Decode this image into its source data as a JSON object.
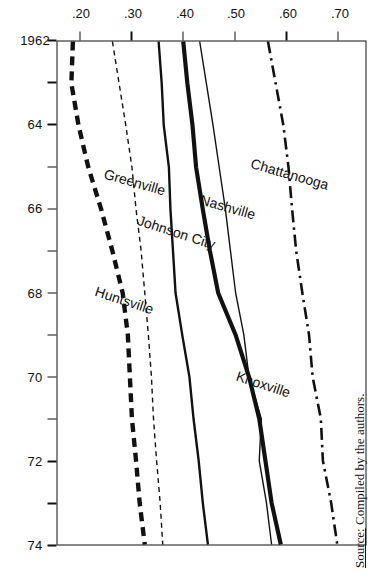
{
  "figure": {
    "y_axis_title": "Proportion",
    "source_prefix": "Source:",
    "source_text": "Compiled by the authors."
  },
  "chart_data": {
    "type": "line",
    "title": "",
    "xlabel": "",
    "ylabel": "Proportion",
    "xlim": [
      1962,
      1974
    ],
    "ylim": [
      0.155,
      0.755
    ],
    "grid": false,
    "legend": "inline-labels",
    "x": [
      1962,
      1963,
      1964,
      1965,
      1966,
      1967,
      1968,
      1969,
      1970,
      1971,
      1972,
      1973,
      1974
    ],
    "xtick_labels": [
      "1962",
      "",
      "64",
      "",
      "66",
      "",
      "68",
      "",
      "70",
      "",
      "72",
      "",
      "74"
    ],
    "ytick_values": [
      0.7,
      0.6,
      0.5,
      0.4,
      0.3,
      0.2
    ],
    "ytick_labels": [
      ".70",
      ".60",
      ".50",
      ".40",
      ".30",
      ".20"
    ],
    "series": [
      {
        "name": "Chattanooga",
        "style": "dash-dot",
        "width": 2.6,
        "color": "#111111",
        "values": [
          0.565,
          0.58,
          0.595,
          0.605,
          0.612,
          0.62,
          0.632,
          0.645,
          0.652,
          0.668,
          0.672,
          0.688,
          0.7
        ],
        "label_x": 1965.6,
        "label_y": 0.612,
        "label_angle": -74
      },
      {
        "name": "Knoxville",
        "style": "solid",
        "width": 4.2,
        "color": "#111111",
        "values": [
          0.4,
          0.408,
          0.418,
          0.425,
          0.438,
          0.452,
          0.468,
          0.502,
          0.528,
          0.548,
          0.56,
          0.572,
          0.59
        ],
        "label_x": 1970.6,
        "label_y": 0.56,
        "label_angle": -72
      },
      {
        "name": "Nashville",
        "style": "solid",
        "width": 1.4,
        "color": "#111111",
        "values": [
          0.432,
          0.445,
          0.458,
          0.47,
          0.482,
          0.492,
          0.502,
          0.518,
          0.528,
          0.552,
          0.548,
          0.562,
          0.572
        ],
        "label_x": 1966.4,
        "label_y": 0.492,
        "label_angle": -74
      },
      {
        "name": "Johnson City",
        "style": "solid",
        "width": 2.4,
        "color": "#111111",
        "values": [
          0.352,
          0.358,
          0.362,
          0.372,
          0.375,
          0.38,
          0.385,
          0.398,
          0.412,
          0.42,
          0.43,
          0.438,
          0.448
        ],
        "label_x": 1967.0,
        "label_y": 0.392,
        "label_angle": -72
      },
      {
        "name": "Greenville",
        "style": "fine-dash",
        "width": 1.4,
        "color": "#111111",
        "values": [
          0.262,
          0.275,
          0.288,
          0.3,
          0.308,
          0.318,
          0.325,
          0.332,
          0.338,
          0.342,
          0.348,
          0.355,
          0.36
        ],
        "label_x": 1965.8,
        "label_y": 0.312,
        "label_angle": -74
      },
      {
        "name": "Huntsville",
        "style": "heavy-dash",
        "width": 4.4,
        "color": "#111111",
        "values": [
          0.185,
          0.182,
          0.196,
          0.215,
          0.24,
          0.262,
          0.282,
          0.292,
          0.296,
          0.3,
          0.308,
          0.315,
          0.325
        ],
        "label_x": 1968.6,
        "label_y": 0.29,
        "label_angle": -72
      }
    ]
  }
}
